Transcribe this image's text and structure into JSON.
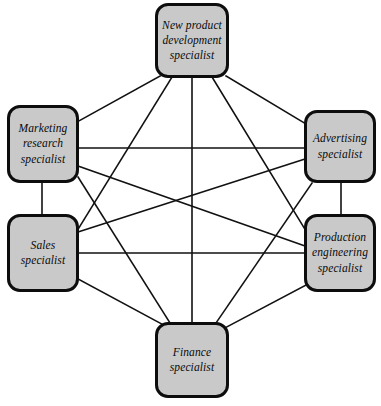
{
  "diagram": {
    "type": "fully-connected network diagram",
    "background_color": "#ffffff",
    "node_fill_color": "#c9c9c9",
    "node_border_color": "#0d0d0d",
    "edge_color": "#111111",
    "nodes": [
      {
        "id": "new-product-development",
        "label": "New product development specialist",
        "x": 155,
        "y": 3,
        "w": 74,
        "h": 75
      },
      {
        "id": "marketing-research",
        "label": "Marketing research specialist",
        "x": 7,
        "y": 105,
        "w": 72,
        "h": 78
      },
      {
        "id": "advertising",
        "label": "Advertising specialist",
        "x": 304,
        "y": 110,
        "w": 72,
        "h": 73
      },
      {
        "id": "sales",
        "label": "Sales specialist",
        "x": 7,
        "y": 214,
        "w": 72,
        "h": 78
      },
      {
        "id": "production-engineering",
        "label": "Production engineering specialist",
        "x": 304,
        "y": 214,
        "w": 72,
        "h": 78
      },
      {
        "id": "finance",
        "label": "Finance specialist",
        "x": 155,
        "y": 322,
        "w": 74,
        "h": 76
      }
    ],
    "edges": [
      {
        "from": "new-product-development",
        "to": "marketing-research",
        "x1": 160,
        "y1": 76,
        "x2": 77,
        "y2": 122
      },
      {
        "from": "new-product-development",
        "to": "sales",
        "x1": 172,
        "y1": 77,
        "x2": 77,
        "y2": 231
      },
      {
        "from": "new-product-development",
        "to": "finance",
        "x1": 192,
        "y1": 77,
        "x2": 192,
        "y2": 322
      },
      {
        "from": "new-product-development",
        "to": "production-engineering",
        "x1": 212,
        "y1": 77,
        "x2": 306,
        "y2": 231
      },
      {
        "from": "new-product-development",
        "to": "advertising",
        "x1": 226,
        "y1": 76,
        "x2": 306,
        "y2": 124
      },
      {
        "from": "marketing-research",
        "to": "advertising",
        "x1": 79,
        "y1": 148,
        "x2": 304,
        "y2": 148
      },
      {
        "from": "marketing-research",
        "to": "sales",
        "x1": 42,
        "y1": 183,
        "x2": 42,
        "y2": 214
      },
      {
        "from": "marketing-research",
        "to": "production-engineering",
        "x1": 78,
        "y1": 166,
        "x2": 305,
        "y2": 246
      },
      {
        "from": "marketing-research",
        "to": "finance",
        "x1": 78,
        "y1": 177,
        "x2": 170,
        "y2": 323
      },
      {
        "from": "sales",
        "to": "advertising",
        "x1": 78,
        "y1": 232,
        "x2": 305,
        "y2": 159
      },
      {
        "from": "sales",
        "to": "production-engineering",
        "x1": 79,
        "y1": 253,
        "x2": 304,
        "y2": 253
      },
      {
        "from": "sales",
        "to": "finance",
        "x1": 78,
        "y1": 279,
        "x2": 171,
        "y2": 329
      },
      {
        "from": "advertising",
        "to": "production-engineering",
        "x1": 341,
        "y1": 183,
        "x2": 341,
        "y2": 214
      },
      {
        "from": "advertising",
        "to": "finance",
        "x1": 312,
        "y1": 183,
        "x2": 216,
        "y2": 323
      },
      {
        "from": "production-engineering",
        "to": "finance",
        "x1": 306,
        "y1": 285,
        "x2": 221,
        "y2": 330
      }
    ]
  }
}
